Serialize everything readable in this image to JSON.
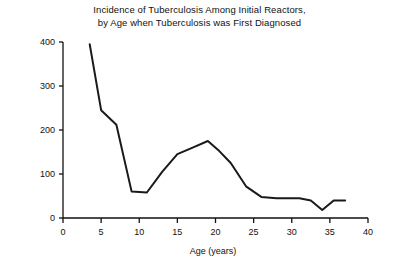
{
  "chart_data": {
    "type": "line",
    "title": "Incidence of Tuberculosis Among Initial Reactors, by Age when Tuberculosis was First Diagnosed",
    "title_line1": "Incidence of Tuberculosis Among Initial Reactors,",
    "title_line2": "by Age when Tuberculosis was First Diagnosed",
    "xlabel": "Age (years)",
    "ylabel": "Average annual case rate (per 100,000)",
    "xlim": [
      0,
      40
    ],
    "ylim": [
      0,
      400
    ],
    "xticks": [
      0,
      5,
      10,
      15,
      20,
      25,
      30,
      35,
      40
    ],
    "xticklabels": [
      "0",
      "5",
      "10",
      "15",
      "20",
      "25",
      "30",
      "35",
      "40"
    ],
    "yticks": [
      0,
      100,
      200,
      300,
      400
    ],
    "yticklabels": [
      "0",
      "100",
      "200",
      "300",
      "400"
    ],
    "grid": false,
    "legend": false,
    "line_color": "#1a1a1a",
    "line_width": 2.0,
    "series": [
      {
        "name": "Average annual case rate",
        "x": [
          3.5,
          5,
          7,
          9,
          11,
          13,
          15,
          17,
          19,
          20.5,
          22,
          24,
          26,
          28,
          31,
          32.5,
          34,
          35.5,
          37
        ],
        "values": [
          395,
          245,
          212,
          60,
          58,
          105,
          145,
          160,
          175,
          152,
          125,
          72,
          48,
          45,
          45,
          40,
          18,
          40,
          40
        ]
      }
    ]
  }
}
